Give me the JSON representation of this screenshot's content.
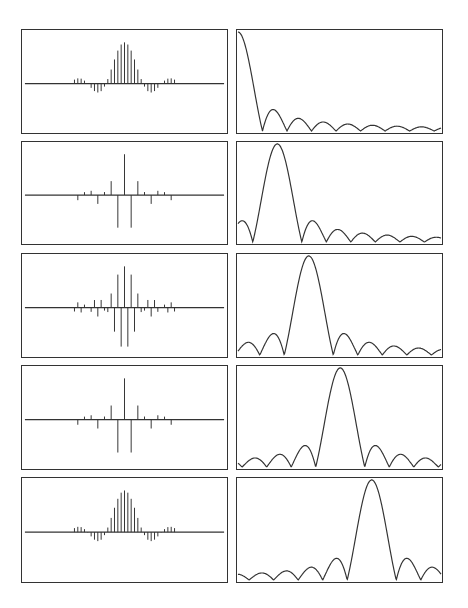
{
  "figure": {
    "rows": [
      {
        "index": 1,
        "modulation": 0.0,
        "peak_position": 0.0
      },
      {
        "index": 2,
        "modulation": 0.125,
        "peak_position": 0.125
      },
      {
        "index": 3,
        "modulation": 0.25,
        "peak_position": 0.25
      },
      {
        "index": 4,
        "modulation": 0.375,
        "peak_position": 0.375
      },
      {
        "index": 5,
        "modulation": 0.5,
        "peak_position": 0.5
      }
    ],
    "colors": {
      "line": "#333333",
      "background": "#ffffff"
    }
  },
  "chart_data": [
    {
      "type": "stem",
      "panel": "row1-left",
      "title": "",
      "xlabel": "",
      "ylabel": "",
      "n_taps": 31,
      "envelope": "sinc-like lowpass, negative side taps at edges",
      "modulation_freq": 0.0
    },
    {
      "type": "line",
      "panel": "row1-right",
      "title": "",
      "xlabel": "",
      "ylabel": "",
      "mainlobe_center": 0.0,
      "sidelobes": "decaying, ~12 visible"
    },
    {
      "type": "stem",
      "panel": "row2-left",
      "n_taps": 31,
      "modulation_freq": 0.125
    },
    {
      "type": "line",
      "panel": "row2-right",
      "mainlobe_center": 0.125
    },
    {
      "type": "stem",
      "panel": "row3-left",
      "n_taps": 31,
      "modulation_freq": 0.25
    },
    {
      "type": "line",
      "panel": "row3-right",
      "mainlobe_center": 0.25
    },
    {
      "type": "stem",
      "panel": "row4-left",
      "n_taps": 31,
      "modulation_freq": 0.375
    },
    {
      "type": "line",
      "panel": "row4-right",
      "mainlobe_center": 0.375
    },
    {
      "type": "stem",
      "panel": "row5-left",
      "n_taps": 31,
      "modulation_freq": 0.5
    },
    {
      "type": "line",
      "panel": "row5-right",
      "mainlobe_center": 0.5
    }
  ]
}
